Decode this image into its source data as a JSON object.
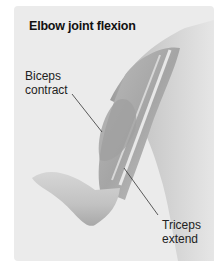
{
  "figure": {
    "title": "Elbow joint flexion",
    "labels": [
      {
        "id": "biceps",
        "line1": "Biceps",
        "line2": "contract"
      },
      {
        "id": "triceps",
        "line1": "Triceps",
        "line2": "extend"
      }
    ],
    "colors": {
      "panel_bg": "#ebebeb",
      "skin_light": "#e2e2e2",
      "skin_mid": "#bdbdbd",
      "skin_dark": "#8a8a8a",
      "leader_line": "#333333"
    }
  }
}
